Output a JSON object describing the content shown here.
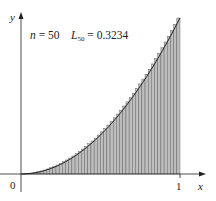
{
  "chart_data": {
    "type": "bar",
    "title": "",
    "function": "y = x^2",
    "annotation": {
      "n_label": "n",
      "n_value": "= 50",
      "L_label": "L",
      "L_sub": "50",
      "L_value": "= 0.3234"
    },
    "n": 50,
    "L50": 0.3234,
    "xlabel": "x",
    "ylabel": "y",
    "x_ticks": [
      "0",
      "1"
    ],
    "xlim": [
      0,
      1
    ],
    "ylim": [
      0,
      1
    ],
    "grid": false,
    "legend": "none",
    "bar_style": "left-endpoint rectangles, gray hatched",
    "colors": {
      "axis": "#222222",
      "curve": "#222222",
      "bar_fill": "#bdbdbd",
      "bar_edge": "#555555"
    }
  },
  "labels": {
    "y_axis": "y",
    "x_axis": "x",
    "origin": "0",
    "one": "1"
  }
}
